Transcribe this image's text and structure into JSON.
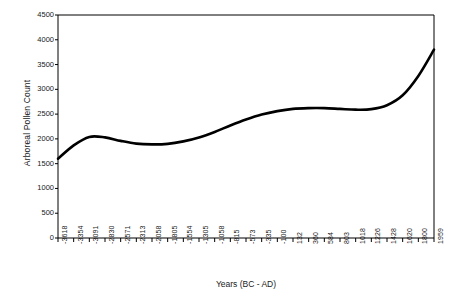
{
  "chart_data": {
    "type": "line",
    "title": "",
    "xlabel": "Years (BC - AD)",
    "ylabel": "Arboreal Pollen Count",
    "ylim": [
      0,
      4500
    ],
    "yticks": [
      0,
      500,
      1000,
      1500,
      2000,
      2500,
      3000,
      3500,
      4000,
      4500
    ],
    "grid": false,
    "legend": "none",
    "line_color": "#000000",
    "line_width": 2.6,
    "categories": [
      "-3618",
      "-3354",
      "-3091",
      "-2830",
      "-2571",
      "-2313",
      "-2058",
      "-1805",
      "-1554",
      "-1305",
      "-1058",
      "-815",
      "-573",
      "-335",
      "-100",
      "132",
      "360",
      "584",
      "803",
      "1018",
      "1226",
      "1428",
      "1620",
      "1800",
      "1959"
    ],
    "values": [
      1600,
      1870,
      2040,
      2030,
      1960,
      1905,
      1890,
      1900,
      1950,
      2030,
      2140,
      2270,
      2390,
      2490,
      2560,
      2605,
      2620,
      2620,
      2605,
      2590,
      2600,
      2680,
      2880,
      3270,
      3800
    ],
    "series": [
      {
        "name": "Arboreal Pollen Count",
        "values": [
          1600,
          1870,
          2040,
          2030,
          1960,
          1905,
          1890,
          1900,
          1950,
          2030,
          2140,
          2270,
          2390,
          2490,
          2560,
          2605,
          2620,
          2620,
          2605,
          2590,
          2600,
          2680,
          2880,
          3270,
          3800
        ]
      }
    ],
    "axis_color": "#000000",
    "background": "#ffffff"
  }
}
